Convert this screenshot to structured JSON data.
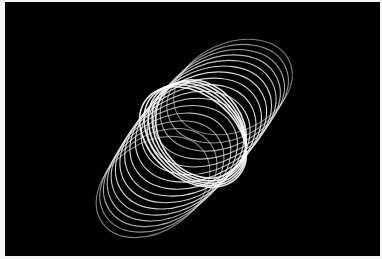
{
  "image": {
    "description": "Long-exposure light painting of white looping elliptical trails on black background",
    "background_color": "#000000",
    "border_color": "#f4f4f4",
    "trail_color": "#e8e8e8"
  }
}
